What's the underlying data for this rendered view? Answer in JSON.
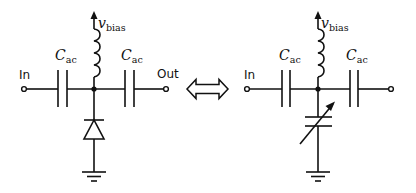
{
  "diagram": {
    "type": "circuit-equivalence",
    "colors": {
      "stroke": "#111111",
      "background": "#ffffff"
    },
    "left_circuit": {
      "name": "varactor-diode bias circuit",
      "labels": {
        "input": "In",
        "output": "Out",
        "bias_main": "v",
        "bias_sub": "bias",
        "cap_left_main": "C",
        "cap_left_sub": "ac",
        "cap_right_main": "C",
        "cap_right_sub": "ac"
      },
      "components": [
        "input-terminal",
        "coupling-capacitor",
        "bias-inductor",
        "varactor-diode",
        "coupling-capacitor",
        "output-terminal",
        "ground"
      ]
    },
    "equivalence_symbol": "double-arrow",
    "right_circuit": {
      "name": "variable-capacitor equivalent circuit",
      "labels": {
        "input": "In",
        "bias_main": "v",
        "bias_sub": "bias",
        "cap_left_main": "C",
        "cap_left_sub": "ac",
        "cap_right_main": "C",
        "cap_right_sub": "ac"
      },
      "components": [
        "input-terminal",
        "coupling-capacitor",
        "bias-inductor",
        "variable-capacitor",
        "coupling-capacitor",
        "output-terminal",
        "ground"
      ]
    }
  }
}
